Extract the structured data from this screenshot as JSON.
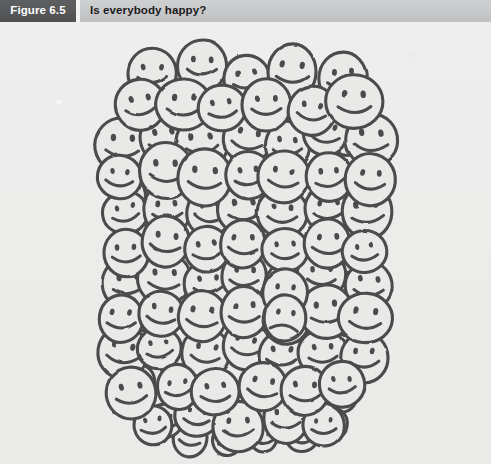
{
  "figure": {
    "number_label": "Figure 6.5",
    "title": "Is everybody happy?",
    "number_box_color": "#58595b",
    "header_bar_color": "#c7c8c9",
    "title_text_color": "#1c1c1c",
    "number_text_color": "#ffffff"
  },
  "artwork": {
    "name": "crowd-of-smiley-faces",
    "description": "Hand-drawn cluster of smiley faces, nearly all smiling with two frowning",
    "ink_color": "#4b4b4d",
    "fill_color": "#e9e9e8",
    "background_color": "#ececeb",
    "total_faces": 100,
    "happy_faces": 98,
    "sad_faces": 2,
    "sad_face_positions": [
      {
        "x": 285,
        "y": 293
      },
      {
        "x": 285,
        "y": 318
      }
    ],
    "cluster_bounds": {
      "left": 125,
      "top": 48,
      "right": 365,
      "bottom": 450
    }
  }
}
